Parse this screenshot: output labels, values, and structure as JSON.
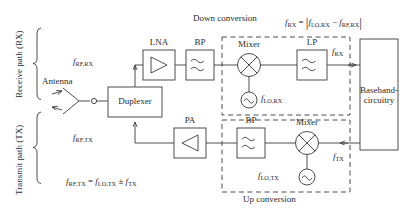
{
  "figure": {
    "stroke_color": "#3a3a3a",
    "text_color": "#2b2b2b",
    "background": "#ffffff"
  },
  "paths": {
    "receive_label": "Receive path (RX)",
    "transmit_label": "Transmit path (TX)"
  },
  "antenna": {
    "label": "Antenna"
  },
  "blocks": {
    "duplexer": "Duplexer",
    "lna": "LNA",
    "bp_rx": "BP",
    "mixer_rx": "Mixer",
    "lp_rx": "LP",
    "pa": "PA",
    "bp_tx": "BP",
    "mixer_tx": "Mixer",
    "baseband_line1": "Baseband-",
    "baseband_line2": "circuitry"
  },
  "groups": {
    "down_conversion": "Down conversion",
    "up_conversion": "Up conversion"
  },
  "signals": {
    "f_rf_rx": {
      "base": "f",
      "sub": "RF,RX"
    },
    "f_rf_tx": {
      "base": "f",
      "sub": "RF,TX"
    },
    "f_lo_rx": {
      "base": "f",
      "sub": "LO,RX"
    },
    "f_lo_tx": {
      "base": "f",
      "sub": "LO,TX"
    },
    "f_rx": {
      "base": "f",
      "sub": "RX"
    },
    "f_tx": {
      "base": "f",
      "sub": "TX"
    }
  },
  "equations": {
    "rx": "f_RX = | f_LO,RX - f_RF,RX |",
    "tx": "f_RF,TX = f_LO,TX ± f_TX"
  }
}
